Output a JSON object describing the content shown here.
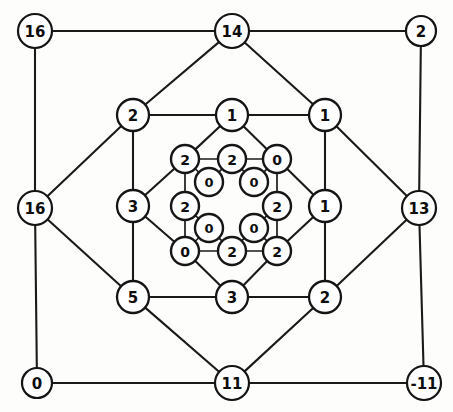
{
  "figure": {
    "name": "nested-ring-graph",
    "background_color": "#fdfdfc",
    "node_fill": "#ffffff",
    "node_stroke": "#141414",
    "edge_color": "#1a1a1a"
  },
  "rings": {
    "outer": {
      "name": "outer-square-ring",
      "nodes": [
        {
          "id": "o-nw",
          "label": "16",
          "cx": 35,
          "cy": 31,
          "r": 17
        },
        {
          "id": "o-n",
          "label": "14",
          "cx": 232,
          "cy": 31,
          "r": 17
        },
        {
          "id": "o-ne",
          "label": "2",
          "cx": 421,
          "cy": 31,
          "r": 15
        },
        {
          "id": "o-w",
          "label": "16",
          "cx": 35,
          "cy": 208,
          "r": 17
        },
        {
          "id": "o-e",
          "label": "13",
          "cx": 419,
          "cy": 208,
          "r": 17
        },
        {
          "id": "o-sw",
          "label": "0",
          "cx": 37,
          "cy": 383,
          "r": 15
        },
        {
          "id": "o-s",
          "label": "11",
          "cx": 232,
          "cy": 383,
          "r": 17
        },
        {
          "id": "o-se",
          "label": "-11",
          "cx": 424,
          "cy": 383,
          "r": 17
        }
      ],
      "edges": [
        [
          "o-nw",
          "o-n"
        ],
        [
          "o-n",
          "o-ne"
        ],
        [
          "o-nw",
          "o-w"
        ],
        [
          "o-ne",
          "o-e"
        ],
        [
          "o-w",
          "o-sw"
        ],
        [
          "o-e",
          "o-se"
        ],
        [
          "o-sw",
          "o-s"
        ],
        [
          "o-s",
          "o-se"
        ],
        [
          "o-n",
          "m-nw"
        ],
        [
          "o-n",
          "m-ne"
        ],
        [
          "o-w",
          "m-nw"
        ],
        [
          "o-w",
          "m-sw"
        ],
        [
          "o-e",
          "m-ne"
        ],
        [
          "o-e",
          "m-se"
        ],
        [
          "o-s",
          "m-sw"
        ],
        [
          "o-s",
          "m-se"
        ]
      ]
    },
    "middle": {
      "name": "middle-octagon-ring",
      "nodes": [
        {
          "id": "m-nw",
          "label": "2",
          "cx": 133,
          "cy": 115,
          "r": 16
        },
        {
          "id": "m-n",
          "label": "1",
          "cx": 232,
          "cy": 115,
          "r": 16
        },
        {
          "id": "m-ne",
          "label": "1",
          "cx": 325,
          "cy": 115,
          "r": 16
        },
        {
          "id": "m-w",
          "label": "3",
          "cx": 133,
          "cy": 206,
          "r": 16
        },
        {
          "id": "m-e",
          "label": "1",
          "cx": 325,
          "cy": 206,
          "r": 16
        },
        {
          "id": "m-sw",
          "label": "5",
          "cx": 133,
          "cy": 297,
          "r": 16
        },
        {
          "id": "m-s",
          "label": "3",
          "cx": 232,
          "cy": 297,
          "r": 16
        },
        {
          "id": "m-se",
          "label": "2",
          "cx": 325,
          "cy": 297,
          "r": 16
        }
      ],
      "edges": [
        [
          "m-nw",
          "m-n"
        ],
        [
          "m-n",
          "m-ne"
        ],
        [
          "m-nw",
          "m-w"
        ],
        [
          "m-ne",
          "m-e"
        ],
        [
          "m-w",
          "m-sw"
        ],
        [
          "m-e",
          "m-se"
        ],
        [
          "m-sw",
          "m-s"
        ],
        [
          "m-s",
          "m-se"
        ],
        [
          "m-n",
          "i-nw"
        ],
        [
          "m-n",
          "i-ne"
        ],
        [
          "m-w",
          "i-nw"
        ],
        [
          "m-w",
          "i-sw"
        ],
        [
          "m-e",
          "i-ne"
        ],
        [
          "m-e",
          "i-se"
        ],
        [
          "m-s",
          "i-sw"
        ],
        [
          "m-s",
          "i-se"
        ]
      ]
    },
    "inner": {
      "name": "inner-octagon-ring",
      "nodes": [
        {
          "id": "i-nw",
          "label": "2",
          "cx": 185,
          "cy": 159,
          "r": 14
        },
        {
          "id": "i-n",
          "label": "2",
          "cx": 232,
          "cy": 159,
          "r": 14
        },
        {
          "id": "i-ne",
          "label": "0",
          "cx": 277,
          "cy": 159,
          "r": 14
        },
        {
          "id": "i-w",
          "label": "2",
          "cx": 185,
          "cy": 206,
          "r": 14
        },
        {
          "id": "i-e",
          "label": "2",
          "cx": 277,
          "cy": 206,
          "r": 14
        },
        {
          "id": "i-sw",
          "label": "0",
          "cx": 185,
          "cy": 251,
          "r": 14
        },
        {
          "id": "i-s",
          "label": "2",
          "cx": 232,
          "cy": 251,
          "r": 14
        },
        {
          "id": "i-se",
          "label": "2",
          "cx": 277,
          "cy": 251,
          "r": 14
        }
      ],
      "edges": [
        [
          "i-nw",
          "i-n"
        ],
        [
          "i-n",
          "i-ne"
        ],
        [
          "i-nw",
          "i-w"
        ],
        [
          "i-ne",
          "i-e"
        ],
        [
          "i-w",
          "i-sw"
        ],
        [
          "i-e",
          "i-se"
        ],
        [
          "i-sw",
          "i-s"
        ],
        [
          "i-s",
          "i-se"
        ],
        [
          "i-nw",
          "c-nw"
        ],
        [
          "i-n",
          "c-nw"
        ],
        [
          "i-n",
          "c-ne"
        ],
        [
          "i-ne",
          "c-ne"
        ],
        [
          "i-w",
          "c-sw"
        ],
        [
          "i-sw",
          "c-sw"
        ],
        [
          "i-s",
          "c-sw"
        ],
        [
          "i-s",
          "c-se"
        ],
        [
          "i-e",
          "c-se"
        ],
        [
          "i-se",
          "c-se"
        ]
      ]
    },
    "core": {
      "name": "core-diagonal-nodes",
      "nodes": [
        {
          "id": "c-nw",
          "label": "0",
          "cx": 209,
          "cy": 182,
          "r": 14
        },
        {
          "id": "c-ne",
          "label": "0",
          "cx": 254,
          "cy": 182,
          "r": 14
        },
        {
          "id": "c-sw",
          "label": "0",
          "cx": 209,
          "cy": 228,
          "r": 14
        },
        {
          "id": "c-se",
          "label": "0",
          "cx": 254,
          "cy": 228,
          "r": 14
        }
      ],
      "edges": []
    }
  },
  "chart_data": {
    "type": "diagram",
    "diagram_kind": "nested-concentric-graph",
    "title": "",
    "ring_count": 4,
    "node_count": 28,
    "labels_by_ring": {
      "outer": [
        "16",
        "14",
        "2",
        "16",
        "13",
        "0",
        "11",
        "-11"
      ],
      "middle": [
        "2",
        "1",
        "1",
        "3",
        "1",
        "5",
        "3",
        "2"
      ],
      "inner": [
        "2",
        "2",
        "0",
        "2",
        "2",
        "0",
        "2",
        "2"
      ],
      "core": [
        "0",
        "0",
        "0",
        "0"
      ]
    }
  }
}
